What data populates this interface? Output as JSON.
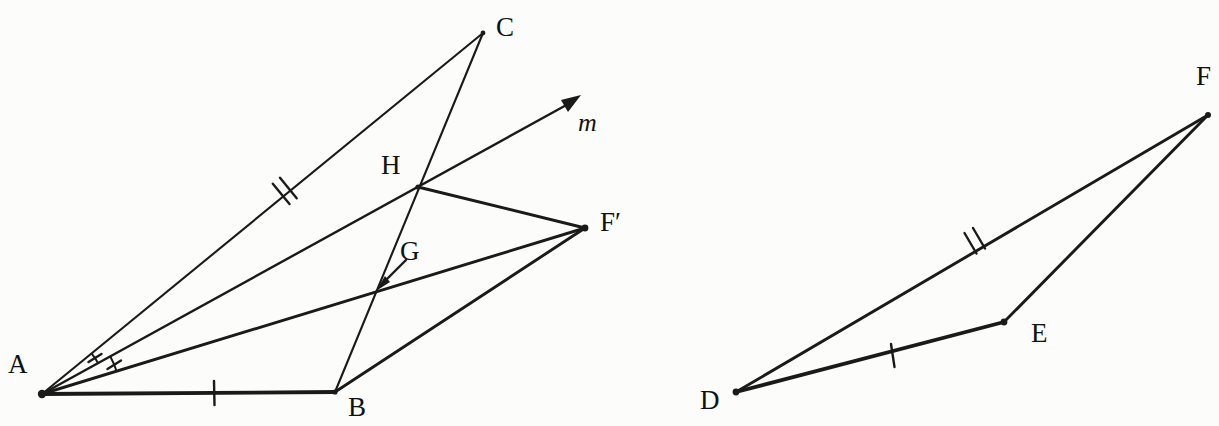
{
  "figure": {
    "background_color": "#fcfcfa",
    "ink_color": "#1a1a1a",
    "width": 1219,
    "height": 426
  },
  "left_figure": {
    "name": "triangle-abc-reflection-construction",
    "points": {
      "A": {
        "label": "A",
        "x": 42,
        "y": 394,
        "label_x": 8,
        "label_y": 351
      },
      "B": {
        "label": "B",
        "x": 335,
        "y": 392,
        "label_x": 348,
        "label_y": 394
      },
      "C": {
        "label": "C",
        "x": 483,
        "y": 33,
        "label_x": 496,
        "label_y": 14
      },
      "G": {
        "label": "G",
        "x": 388,
        "y": 292,
        "label_x": 400,
        "label_y": 238
      },
      "H": {
        "label": "H",
        "x": 418,
        "y": 187,
        "label_x": 381,
        "label_y": 152
      },
      "Fp": {
        "label": "F′",
        "x": 585,
        "y": 228,
        "label_x": 600,
        "label_y": 209
      },
      "m": {
        "label": "m",
        "x": 578,
        "y": 97,
        "label_x": 578,
        "label_y": 110
      }
    },
    "segments": [
      {
        "name": "segment-a-c",
        "from": "A",
        "to": "C",
        "weight": "thin",
        "ticks": 2
      },
      {
        "name": "segment-a-b",
        "from": "A",
        "to": "B",
        "weight": "thick",
        "ticks": 1
      },
      {
        "name": "segment-c-b",
        "from": "C",
        "to": "B",
        "weight": "thin",
        "ticks": 0
      },
      {
        "name": "segment-a-fprime",
        "from": "A",
        "to": "Fp",
        "weight": "med",
        "ticks": 0
      },
      {
        "name": "segment-h-fprime",
        "from": "H",
        "to": "Fp",
        "weight": "med",
        "ticks": 0
      },
      {
        "name": "segment-b-fprime",
        "from": "B",
        "to": "Fp",
        "weight": "med",
        "ticks": 0
      }
    ],
    "ray": {
      "name": "ray-m",
      "from": "A",
      "through": "H",
      "tip_x": 578,
      "tip_y": 97,
      "label": "m"
    },
    "angle_arcs": [
      {
        "name": "angle-arc-upper",
        "radius": 64,
        "ticks": 1
      },
      {
        "name": "angle-arc-lower",
        "radius": 78,
        "ticks": 1
      }
    ],
    "pointer": {
      "name": "g-pointer-arrow",
      "from_x": 405,
      "from_y": 261,
      "to_x": 378,
      "to_y": 288
    }
  },
  "right_figure": {
    "name": "triangle-def",
    "points": {
      "D": {
        "label": "D",
        "x": 736,
        "y": 392,
        "label_x": 700,
        "label_y": 387
      },
      "E": {
        "label": "E",
        "x": 1004,
        "y": 322,
        "label_x": 1031,
        "label_y": 320
      },
      "F": {
        "label": "F",
        "x": 1208,
        "y": 115,
        "label_x": 1196,
        "label_y": 63
      }
    },
    "segments": [
      {
        "name": "segment-d-f",
        "from": "D",
        "to": "F",
        "weight": "med",
        "ticks": 2
      },
      {
        "name": "segment-d-e",
        "from": "D",
        "to": "E",
        "weight": "thick",
        "ticks": 1
      },
      {
        "name": "segment-e-f",
        "from": "E",
        "to": "F",
        "weight": "med",
        "ticks": 0
      }
    ]
  }
}
